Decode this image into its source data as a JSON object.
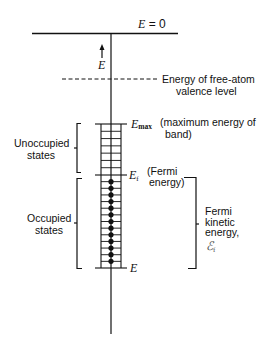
{
  "diagram": {
    "title_label": "E = 0",
    "title_label_parts": {
      "var": "E",
      "eq": " = 0"
    },
    "axis_label": "E",
    "free_atom_label_line1": "Energy of free-atom",
    "free_atom_label_line2": "valence level",
    "emax_var": "E",
    "emax_sub": "max",
    "emax_desc_line1": "(maximum energy of",
    "emax_desc_line2": "band)",
    "ef_var": "E",
    "ef_sub": "f",
    "ef_desc_line1": "(Fermi",
    "ef_desc_line2": "energy)",
    "bottom_var": "E",
    "unoccupied_line1": "Unoccupied",
    "unoccupied_line2": "states",
    "occupied_line1": "Occupied",
    "occupied_line2": "states",
    "fermi_ke_line1": "Fermi",
    "fermi_ke_line2": "kinetic",
    "fermi_ke_line3": "energy,",
    "fermi_ke_symbol": "ℰ",
    "fermi_ke_sub": "f",
    "unoccupied_rungs": 7,
    "occupied_rungs": 14,
    "occupied_dots": 13,
    "colors": {
      "ink": "#111111",
      "background": "#ffffff"
    }
  }
}
